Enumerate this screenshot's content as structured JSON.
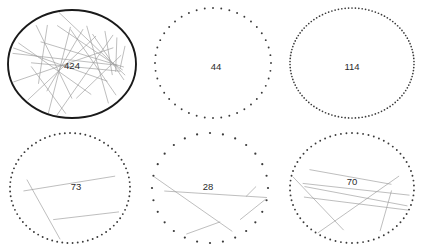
{
  "figure": {
    "type": "diagram",
    "background_color": "#ffffff",
    "width": 421,
    "height": 249,
    "grid": {
      "rows": 2,
      "cols": 3
    },
    "chord_color": "#9a9a9a",
    "solid_ring_color": "#1a1a1a",
    "dot_ring_color": "#3a3a3a",
    "label_color": "#2b2b2b",
    "cells": [
      {
        "id": "cell-1",
        "label": "424",
        "label_x": 72,
        "label_y": 66,
        "cx": 72,
        "cy": 64,
        "rx": 64,
        "ry": 54,
        "ring_style": "solid",
        "ring_stroke_width": 1.9,
        "dot_count": 0,
        "dot_radius": 0,
        "chord_count": 22,
        "chords": [
          [
            128,
            10,
            285,
            95
          ],
          [
            8,
            200,
            252,
            160
          ],
          [
            62,
            12,
            205,
            300
          ],
          [
            176,
            8,
            96,
            300
          ],
          [
            12,
            118,
            325,
            245
          ],
          [
            20,
            252,
            300,
            70
          ],
          [
            145,
            18,
            242,
            215
          ],
          [
            6,
            165,
            338,
            275
          ],
          [
            40,
            280,
            268,
            40
          ],
          [
            90,
            5,
            232,
            290
          ],
          [
            18,
            90,
            310,
            200
          ],
          [
            160,
            340,
            335,
            130
          ],
          [
            4,
            210,
            220,
            25
          ],
          [
            112,
            352,
            268,
            110
          ],
          [
            30,
            58,
            198,
            332
          ],
          [
            84,
            20,
            348,
            188
          ],
          [
            14,
            245,
            258,
            340
          ],
          [
            182,
            16,
            10,
            175
          ],
          [
            136,
            330,
            306,
            52
          ],
          [
            52,
            300,
            288,
            155
          ],
          [
            2,
            130,
            192,
            320
          ],
          [
            104,
            342,
            320,
            230
          ]
        ]
      },
      {
        "id": "cell-2",
        "label": "44",
        "label_x": 216,
        "label_y": 67,
        "cx": 213,
        "cy": 63,
        "rx": 58,
        "ry": 55,
        "ring_style": "dotted",
        "ring_stroke_width": 0,
        "dot_count": 44,
        "dot_radius": 0.95,
        "chord_count": 0,
        "chords": []
      },
      {
        "id": "cell-3",
        "label": "114",
        "label_x": 352,
        "label_y": 67,
        "cx": 352,
        "cy": 63,
        "rx": 62,
        "ry": 55,
        "ring_style": "dotted",
        "ring_stroke_width": 0,
        "dot_count": 114,
        "dot_radius": 0.85,
        "chord_count": 0,
        "chords": []
      },
      {
        "id": "cell-4",
        "label": "73",
        "label_x": 76,
        "label_y": 187,
        "cx": 70,
        "cy": 188,
        "rx": 60,
        "ry": 55,
        "ring_style": "dotted",
        "ring_stroke_width": 0,
        "dot_count": 73,
        "dot_radius": 0.95,
        "chord_count": 3,
        "chords": [
          [
            28,
            300,
            116,
            42
          ],
          [
            176,
            182,
            344,
            186
          ],
          [
            192,
            148,
            100,
            318
          ]
        ]
      },
      {
        "id": "cell-5",
        "label": "28",
        "label_x": 208,
        "label_y": 187,
        "cx": 210,
        "cy": 188,
        "rx": 58,
        "ry": 55,
        "ring_style": "dotted",
        "ring_stroke_width": 0,
        "dot_count": 28,
        "dot_radius": 1.1,
        "chord_count": 5,
        "chords": [
          [
            116,
            306,
            74,
            66
          ],
          [
            64,
            262,
            192,
            348
          ],
          [
            176,
            192,
            10,
            358
          ],
          [
            48,
            180,
            12,
            344
          ],
          [
            358,
            196,
            14,
            26
          ]
        ]
      },
      {
        "id": "cell-6",
        "label": "70",
        "label_x": 352,
        "label_y": 182,
        "cx": 352,
        "cy": 188,
        "rx": 62,
        "ry": 55,
        "ring_style": "dotted",
        "ring_stroke_width": 0,
        "dot_count": 70,
        "dot_radius": 0.95,
        "chord_count": 7,
        "chords": [
          [
            100,
            182,
            192,
            338
          ],
          [
            168,
            194,
            24,
            350
          ],
          [
            60,
            284,
            4,
            12
          ],
          [
            206,
            170,
            354,
            8
          ],
          [
            182,
            174,
            20,
            322
          ],
          [
            344,
            192,
            124,
            348
          ],
          [
            186,
            200,
            8,
            310
          ]
        ]
      }
    ]
  }
}
